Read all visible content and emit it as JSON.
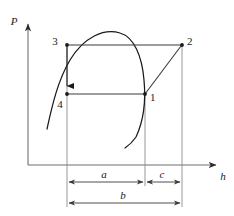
{
  "figure": {
    "type": "thermodynamic-cycle-diagram",
    "background": "#ffffff",
    "line_color": "#3a3a3a",
    "curve_color": "#1a1a1a",
    "text_color": "#1a1a1a"
  },
  "axes": {
    "y_label": "P",
    "x_label": "h",
    "origin": {
      "x": 28,
      "y": 165
    },
    "y_top": {
      "x": 28,
      "y": 22
    },
    "x_right": {
      "x": 218,
      "y": 165
    }
  },
  "state_points": [
    {
      "id": "1",
      "label": "1",
      "x": 145,
      "y": 94,
      "label_x": 150,
      "label_y": 100
    },
    {
      "id": "2",
      "label": "2",
      "x": 182,
      "y": 45,
      "label_x": 187,
      "label_y": 44
    },
    {
      "id": "3",
      "label": "3",
      "x": 67,
      "y": 45,
      "label_x": 55,
      "label_y": 44
    },
    {
      "id": "4",
      "label": "4",
      "x": 67,
      "y": 94,
      "label_x": 59,
      "label_y": 107
    }
  ],
  "process_lines": [
    {
      "name": "line-3-to-2",
      "from": "3",
      "to": "2",
      "style": "horizontal-isobar"
    },
    {
      "name": "line-4-to-1",
      "from": "4",
      "to": "1",
      "style": "horizontal-isobar"
    },
    {
      "name": "line-3-to-4",
      "from": "3",
      "to": "4",
      "style": "vertical-with-arrow"
    },
    {
      "name": "line-1-to-2",
      "from": "1",
      "to": "2",
      "style": "diagonal-compression"
    }
  ],
  "saturation_dome": {
    "name": "saturation-dome",
    "peak": {
      "x": 120,
      "y": 33
    },
    "left_end": {
      "x": 47,
      "y": 129
    },
    "right_end": {
      "x": 125,
      "y": 148
    }
  },
  "dimensions": [
    {
      "id": "a",
      "label": "a",
      "x_start": 67,
      "x_end": 145,
      "y": 182,
      "label_x": 103,
      "label_y": 177
    },
    {
      "id": "c",
      "label": "c",
      "x_start": 145,
      "x_end": 182,
      "y": 182,
      "label_x": 161,
      "label_y": 177
    },
    {
      "id": "b",
      "label": "b",
      "x_start": 67,
      "x_end": 182,
      "y": 203,
      "label_x": 122,
      "label_y": 198
    }
  ],
  "extension_lines": [
    {
      "name": "extension-line-left",
      "x": 67,
      "y_top": 45,
      "y_bottom": 207
    },
    {
      "name": "extension-line-middle",
      "x": 145,
      "y_top": 94,
      "y_bottom": 186
    },
    {
      "name": "extension-line-right",
      "x": 182,
      "y_top": 45,
      "y_bottom": 207
    }
  ]
}
